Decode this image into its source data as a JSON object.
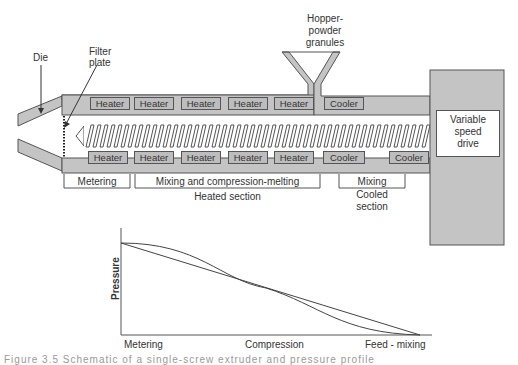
{
  "diagram": {
    "labels": {
      "die": "Die",
      "filter_plate_line1": "Filter",
      "filter_plate_line2": "plate",
      "hopper_line1": "Hopper-",
      "hopper_line2": "powder",
      "hopper_line3": "granules",
      "drive_line1": "Variable",
      "drive_line2": "speed",
      "drive_line3": "drive"
    },
    "top_zones": [
      "Heater",
      "Heater",
      "Heater",
      "Heater",
      "Heater",
      "Cooler"
    ],
    "bottom_zones": [
      "Heater",
      "Heater",
      "Heater",
      "Heater",
      "Heater",
      "Cooler",
      "Cooler"
    ],
    "sections": {
      "metering": "Metering",
      "mixing_compression": "Mixing and compression-melting",
      "heated_section": "Heated section",
      "mixing": "Mixing",
      "cooled_line1": "Cooled",
      "cooled_line2": "section"
    },
    "colors": {
      "barrel_fill": "#c4c4c4",
      "stroke": "#555555",
      "background": "#ffffff"
    }
  },
  "chart_data": {
    "type": "line",
    "title": "",
    "xlabel": "",
    "ylabel": "Pressure",
    "categories": [
      "Metering",
      "Compression",
      "Feed - mixing"
    ],
    "x": [
      0,
      0.5,
      1
    ],
    "series": [
      {
        "name": "linear profile",
        "values": [
          1.0,
          0.5,
          0.0
        ]
      },
      {
        "name": "curved profile",
        "values": [
          1.0,
          0.5,
          0.0
        ]
      }
    ],
    "grid": false,
    "legend": "none"
  },
  "caption": {
    "text": "Figure 3.5  Schematic of a single-screw extruder and pressure profile"
  }
}
